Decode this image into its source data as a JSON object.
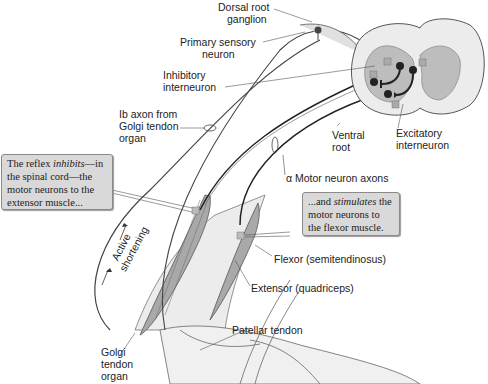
{
  "figure": {
    "colors": {
      "muscle_fill": "#a9a9a9",
      "tissue_fill": "#e6e6e6",
      "gray_matter": "#bdbdbd",
      "white_matter": "#ececec",
      "neuron": "#2b2b2b",
      "callout_bg": "#d9d9d9"
    }
  },
  "labels": {
    "dorsal_root_ganglion": [
      "Dorsal root",
      "ganglion"
    ],
    "primary_sensory_neuron": [
      "Primary sensory",
      "neuron"
    ],
    "inhibitory_interneuron": [
      "Inhibitory",
      "interneuron"
    ],
    "ib_axon": [
      "Ib axon from",
      "Golgi tendon",
      "organ"
    ],
    "ventral_root": [
      "Ventral",
      "root"
    ],
    "excitatory_interneuron": [
      "Excitatory",
      "interneuron"
    ],
    "alpha_motor_axons": "α Motor neuron axons",
    "flexor": "Flexor (semitendinosus)",
    "extensor": "Extensor (quadriceps)",
    "patellar_tendon": "Patellar tendon",
    "golgi_tendon_organ": [
      "Golgi",
      "tendon",
      "organ"
    ],
    "active_shortening": [
      "Active",
      "shortening"
    ]
  },
  "callouts": {
    "inhibits": {
      "pre": "The reflex ",
      "em": "inhibits",
      "post": "—in the spinal cord—the motor neurons to the extensor muscle..."
    },
    "stimulates": {
      "pre": "...and ",
      "em": "stimulates",
      "post": " the motor neurons to the flexor muscle."
    }
  },
  "synapse_signs": {
    "plus": "+",
    "minus": "−"
  }
}
